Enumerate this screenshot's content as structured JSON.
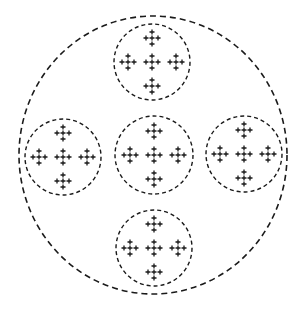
{
  "diagram": {
    "colors": {
      "stroke": "#1a1a1a",
      "background": "#ffffff"
    },
    "outer_circle": {
      "cx": 153,
      "cy": 155,
      "rx": 134,
      "ry": 139,
      "dash": "6 4",
      "stroke_width": 1.6
    },
    "inner_circles": [
      {
        "id": "top",
        "cx": 152,
        "cy": 62,
        "r": 38
      },
      {
        "id": "left",
        "cx": 63,
        "cy": 157,
        "r": 38
      },
      {
        "id": "center",
        "cx": 154,
        "cy": 155,
        "r": 39
      },
      {
        "id": "right",
        "cx": 244,
        "cy": 154,
        "r": 38
      },
      {
        "id": "bottom",
        "cx": 154,
        "cy": 248,
        "r": 38
      }
    ],
    "inner_dash": "4 3",
    "inner_stroke_width": 1.4,
    "cluster_offsets": [
      [
        0,
        -24
      ],
      [
        -24,
        0
      ],
      [
        0,
        0
      ],
      [
        24,
        0
      ],
      [
        0,
        24
      ]
    ],
    "plus_offsets": [
      [
        0,
        -6
      ],
      [
        -6,
        0
      ],
      [
        0,
        0
      ],
      [
        6,
        0
      ],
      [
        0,
        6
      ]
    ],
    "plus_half_size": 2.5
  }
}
